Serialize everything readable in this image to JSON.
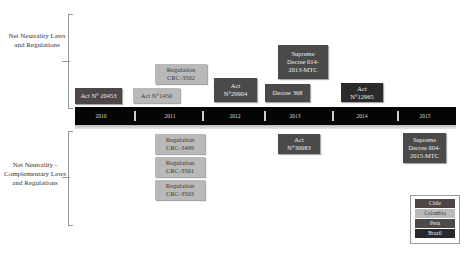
{
  "groups": {
    "top_label": "Net Neutrality Laws and Regulations",
    "bottom_label": "Net Neutrality - Complementary Laws and Regulations"
  },
  "timeline": {
    "years": [
      "2010",
      "2011",
      "2012",
      "2013",
      "2014",
      "2015"
    ]
  },
  "top_items": [
    {
      "label": "Act N° 20453",
      "country": "Chile",
      "year": "2010"
    },
    {
      "label": "Act N°1450",
      "country": "Colombia",
      "year": "2011"
    },
    {
      "label": "Regulation CRC-3502",
      "country": "Colombia",
      "year": "2011"
    },
    {
      "label": "Act N°29904",
      "country": "Peru",
      "year": "2012"
    },
    {
      "label": "Decree 368",
      "country": "Peru",
      "year": "2013"
    },
    {
      "label": "Supreme Decree 014-2013-MTC",
      "country": "Peru",
      "year": "2013"
    },
    {
      "label": "Act N°12965",
      "country": "Brazil",
      "year": "2014"
    }
  ],
  "bottom_items": [
    {
      "label": "Regulation CRC-3499",
      "country": "Colombia",
      "year": "2011"
    },
    {
      "label": "Regulation CRC-3501",
      "country": "Colombia",
      "year": "2011"
    },
    {
      "label": "Regulation CRC-3503",
      "country": "Colombia",
      "year": "2011"
    },
    {
      "label": "Act N°30083",
      "country": "Peru",
      "year": "2013"
    },
    {
      "label": "Supreme Decree 004-2015-MTC",
      "country": "Peru",
      "year": "2015"
    }
  ],
  "legend": {
    "items": [
      {
        "label": "Chile",
        "color": "#4e4646"
      },
      {
        "label": "Colombia",
        "color": "#b9b9b9"
      },
      {
        "label": "Peru",
        "color": "#4a4a4a"
      },
      {
        "label": "Brazil",
        "color": "#2a2a2a"
      }
    ]
  }
}
